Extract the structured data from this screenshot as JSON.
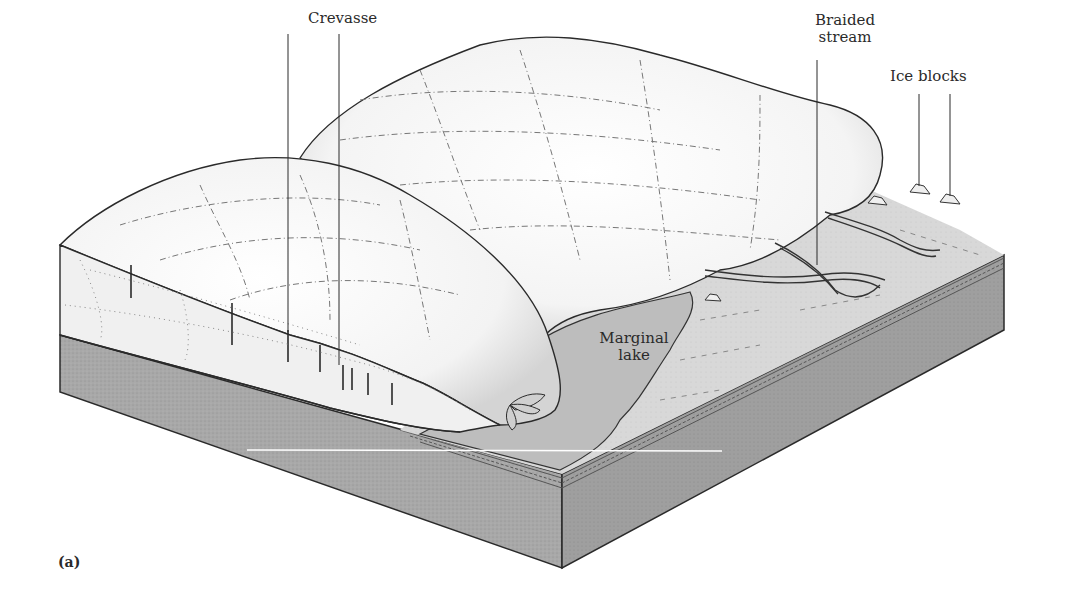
{
  "figure": {
    "panel_label": "(a)",
    "labels": {
      "crevasse": "Crevasse",
      "braided_stream_line1": "Braided",
      "braided_stream_line2": "stream",
      "ice_blocks": "Ice blocks",
      "marginal_lake_line1": "Marginal",
      "marginal_lake_line2": "lake"
    },
    "colors": {
      "ice": "#f7f7f7",
      "ice_shade": "#dcdcdc",
      "outwash_plain": "#d9d9d9",
      "lake": "#bdbdbd",
      "bedrock_front": "#a9a9a9",
      "bedrock_side": "#9a9a9a",
      "line": "#2a2a2a"
    }
  }
}
